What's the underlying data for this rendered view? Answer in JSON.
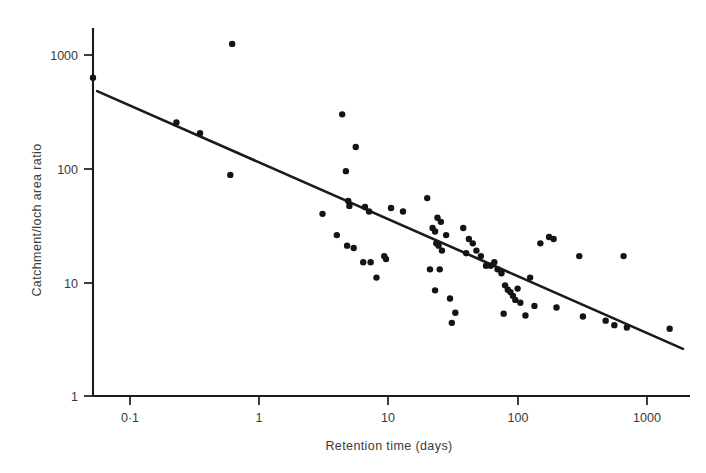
{
  "figure": {
    "background_color": "#ffffff",
    "ink_color": "#1a1a1a",
    "text_color": "#3a3a3a"
  },
  "chart_data": {
    "type": "scatter",
    "title": "",
    "xlabel": "Retention time (days)",
    "ylabel": "Catchment/loch area ratio",
    "xscale": "log",
    "yscale": "log",
    "xlim": [
      0.05,
      2200
    ],
    "ylim": [
      1,
      2000
    ],
    "grid": false,
    "legend": null,
    "xticks": [
      0.1,
      1,
      10,
      100,
      1000
    ],
    "xtick_labels": [
      "0·1",
      "1",
      "10",
      "100",
      "1000"
    ],
    "yticks": [
      1,
      10,
      100,
      1000
    ],
    "ytick_labels": [
      "1",
      "10",
      "100",
      "1000"
    ],
    "marker": "filled-circle",
    "marker_size_px": 3.2,
    "points": [
      {
        "x": 0.052,
        "y": 630
      },
      {
        "x": 0.62,
        "y": 1250
      },
      {
        "x": 0.23,
        "y": 255
      },
      {
        "x": 0.35,
        "y": 205
      },
      {
        "x": 0.6,
        "y": 88
      },
      {
        "x": 4.4,
        "y": 300
      },
      {
        "x": 5.6,
        "y": 155
      },
      {
        "x": 4.7,
        "y": 95
      },
      {
        "x": 3.1,
        "y": 40
      },
      {
        "x": 4.9,
        "y": 52
      },
      {
        "x": 5.0,
        "y": 47
      },
      {
        "x": 6.6,
        "y": 46
      },
      {
        "x": 7.1,
        "y": 42
      },
      {
        "x": 10.5,
        "y": 45
      },
      {
        "x": 13.0,
        "y": 42
      },
      {
        "x": 4.0,
        "y": 26
      },
      {
        "x": 4.8,
        "y": 21
      },
      {
        "x": 5.4,
        "y": 20
      },
      {
        "x": 6.4,
        "y": 15
      },
      {
        "x": 7.3,
        "y": 15
      },
      {
        "x": 9.3,
        "y": 17
      },
      {
        "x": 9.6,
        "y": 16
      },
      {
        "x": 8.1,
        "y": 11
      },
      {
        "x": 20.0,
        "y": 55
      },
      {
        "x": 24.0,
        "y": 37
      },
      {
        "x": 25.5,
        "y": 34
      },
      {
        "x": 22.0,
        "y": 30
      },
      {
        "x": 23.0,
        "y": 28
      },
      {
        "x": 28.0,
        "y": 26
      },
      {
        "x": 23.5,
        "y": 22
      },
      {
        "x": 24.5,
        "y": 21
      },
      {
        "x": 26.0,
        "y": 19
      },
      {
        "x": 21.0,
        "y": 13
      },
      {
        "x": 25.0,
        "y": 13
      },
      {
        "x": 23.0,
        "y": 8.5
      },
      {
        "x": 30.0,
        "y": 7.2
      },
      {
        "x": 33.0,
        "y": 5.4
      },
      {
        "x": 31.0,
        "y": 4.4
      },
      {
        "x": 38.0,
        "y": 30
      },
      {
        "x": 42.0,
        "y": 24
      },
      {
        "x": 45.0,
        "y": 22
      },
      {
        "x": 40.0,
        "y": 18
      },
      {
        "x": 48.0,
        "y": 19
      },
      {
        "x": 52.0,
        "y": 17
      },
      {
        "x": 57.0,
        "y": 14
      },
      {
        "x": 62.0,
        "y": 14
      },
      {
        "x": 66.0,
        "y": 15
      },
      {
        "x": 70.0,
        "y": 13
      },
      {
        "x": 75.0,
        "y": 12
      },
      {
        "x": 80.0,
        "y": 9.4
      },
      {
        "x": 84.0,
        "y": 8.6
      },
      {
        "x": 88.0,
        "y": 8.2
      },
      {
        "x": 92.0,
        "y": 7.6
      },
      {
        "x": 96.0,
        "y": 7.0
      },
      {
        "x": 100.0,
        "y": 8.8
      },
      {
        "x": 105.0,
        "y": 6.6
      },
      {
        "x": 78.0,
        "y": 5.3
      },
      {
        "x": 115.0,
        "y": 5.1
      },
      {
        "x": 125.0,
        "y": 11
      },
      {
        "x": 135.0,
        "y": 6.2
      },
      {
        "x": 150.0,
        "y": 22
      },
      {
        "x": 175.0,
        "y": 25
      },
      {
        "x": 190.0,
        "y": 24
      },
      {
        "x": 200.0,
        "y": 6.0
      },
      {
        "x": 300.0,
        "y": 17
      },
      {
        "x": 320.0,
        "y": 5.0
      },
      {
        "x": 480.0,
        "y": 4.6
      },
      {
        "x": 560.0,
        "y": 4.2
      },
      {
        "x": 660.0,
        "y": 17
      },
      {
        "x": 700.0,
        "y": 4.0
      },
      {
        "x": 1500.0,
        "y": 3.9
      }
    ],
    "fit_line": {
      "label": "regression line",
      "x_start": 0.056,
      "y_start": 480,
      "x_end": 1900,
      "y_end": 2.6
    }
  }
}
